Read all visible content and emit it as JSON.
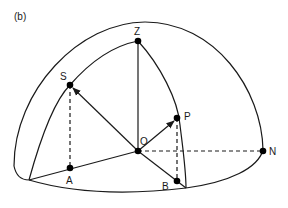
{
  "figure": {
    "panel_label": "(b)",
    "points": {
      "Z": {
        "label": "Z",
        "x": 138,
        "y": 41
      },
      "S": {
        "label": "S",
        "x": 70,
        "y": 85
      },
      "O": {
        "label": "O",
        "x": 138,
        "y": 151
      },
      "P": {
        "label": "P",
        "x": 177,
        "y": 118
      },
      "N": {
        "label": "N",
        "x": 263,
        "y": 151
      },
      "A": {
        "label": "A",
        "x": 70,
        "y": 168
      },
      "B": {
        "label": "B",
        "x": 177,
        "y": 181
      }
    },
    "vectors": [
      "O->S",
      "O->P"
    ],
    "dashed_lines": [
      "S-A",
      "P-B",
      "O-N"
    ],
    "solid_lines": [
      "O-Z",
      "O-A",
      "O-B"
    ],
    "colors": {
      "ink": "#1a1a1a",
      "background": "#ffffff"
    }
  }
}
